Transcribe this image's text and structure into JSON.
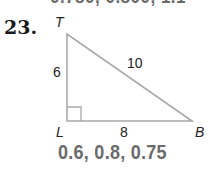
{
  "previous_answer_partial": "0.780, 0.800, 1.1",
  "problem": {
    "number": "23.",
    "figure": {
      "type": "right-triangle",
      "vertices": {
        "top": "T",
        "right_angle": "L",
        "right": "B"
      },
      "sides": {
        "TL": "6",
        "TB": "10",
        "LB": "8"
      },
      "right_angle_at": "L"
    },
    "answer": "0.6, 0.8, 0.75"
  },
  "colors": {
    "line": "#a8a8a8",
    "answer_text": "#6b6b6b",
    "label_text": "#222222"
  }
}
